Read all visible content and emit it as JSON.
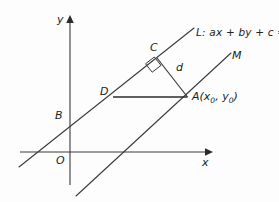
{
  "figure": {
    "background_color": "#fdfdfd",
    "stroke_color": "#3a3a3a",
    "text_color": "#222222"
  },
  "axes": {
    "x_label": "x",
    "y_label": "y",
    "origin_label": "O",
    "x_axis": {
      "x1": 20,
      "y1": 152,
      "x2": 208,
      "y2": 152
    },
    "y_axis": {
      "x1": 70,
      "y1": 185,
      "x2": 70,
      "y2": 20
    }
  },
  "lines": [
    {
      "name": "line-L",
      "label": "L: ax + by + c = 0",
      "label_prefix": "L",
      "equation": "ax + by + c = 0",
      "x1": 19,
      "y1": 167,
      "x2": 194,
      "y2": 28
    },
    {
      "name": "line-M",
      "label": "M",
      "x1": 76,
      "y1": 196,
      "x2": 231,
      "y2": 53
    }
  ],
  "segments": [
    {
      "name": "segment-DA",
      "from": "D",
      "to": "A",
      "x1": 113,
      "y1": 97,
      "x2": 187,
      "y2": 97
    },
    {
      "name": "segment-d",
      "label": "d",
      "from": "C",
      "to": "A",
      "x1": 157,
      "y1": 58,
      "x2": 187,
      "y2": 97
    }
  ],
  "points": [
    {
      "name": "point-C",
      "label": "C",
      "x": 157,
      "y": 58
    },
    {
      "name": "point-D",
      "label": "D",
      "x": 113,
      "y": 97
    },
    {
      "name": "point-A",
      "label": "A",
      "coords": "(x0, y0)",
      "x": 187,
      "y": 97
    },
    {
      "name": "point-B",
      "label": "B",
      "x": 70,
      "y": 118
    },
    {
      "name": "point-O",
      "label": "O",
      "x": 70,
      "y": 152
    }
  ],
  "markers": {
    "right_angle": {
      "name": "right-angle-marker",
      "at_point": "C",
      "points": "145.5,63.5 151.5,71.5 160.5,65.5 154.5,57.5"
    }
  },
  "label_a": "A",
  "label_a_sub1": "x",
  "label_a_sub2": "y",
  "label_a_zero": "0"
}
